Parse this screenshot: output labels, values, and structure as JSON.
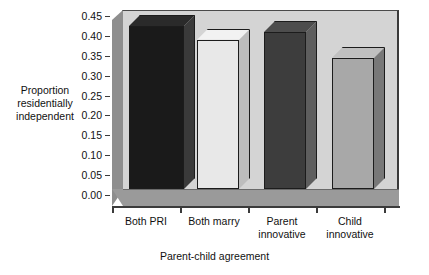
{
  "chart_data": {
    "type": "bar",
    "title": "",
    "subtitle": "",
    "xlabel": "Parent-child agreement",
    "ylabel": "Proportion residentially independent",
    "ylabel_lines": [
      "Proportion",
      "residentially",
      "independent"
    ],
    "categories": [
      "Both PRI",
      "Both marry",
      "Parent innovative",
      "Child innovative"
    ],
    "category_lines": [
      [
        "Both PRI"
      ],
      [
        "Both marry"
      ],
      [
        "Parent",
        "innovative"
      ],
      [
        "Child",
        "innovative"
      ]
    ],
    "values": [
      0.41,
      0.375,
      0.395,
      0.33
    ],
    "ylim": [
      0.0,
      0.45
    ],
    "ytick_values": [
      0.0,
      0.05,
      0.1,
      0.15,
      0.2,
      0.25,
      0.3,
      0.35,
      0.4,
      0.45
    ],
    "ytick_labels": [
      "0.00",
      "0.05",
      "0.10",
      "0.15",
      "0.20",
      "0.25",
      "0.30",
      "0.35",
      "0.40",
      "0.45"
    ],
    "grid": false,
    "legend": null,
    "style": "3d-bar",
    "bar_colors": [
      "#1a1a1a",
      "#e8e8e8",
      "#3d3d3d",
      "#a8a8a8"
    ],
    "bar_side_colors": [
      "#3a3a3a",
      "#bdbdbd",
      "#5e5e5e",
      "#787878"
    ],
    "bar_top_colors": [
      "#2a2a2a",
      "#f2f2f2",
      "#4d4d4d",
      "#c0c0c0"
    ],
    "plot_background": "#d4d4d4",
    "axis_color": "#3b3b3b",
    "wall_color": "#8e8e8e",
    "floor_color": "#9a9a9a"
  }
}
